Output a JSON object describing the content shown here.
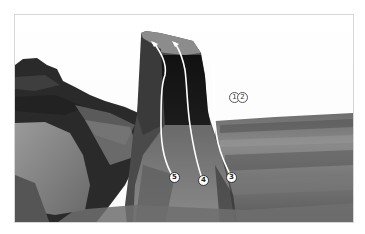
{
  "figure": {
    "type": "climbing-topo-photo",
    "color_mode": "grayscale",
    "frame_border_color": "#d6d6d6",
    "route_line_color": "#ffffff",
    "routes_on_boulder": [
      {
        "number": "5"
      },
      {
        "number": "4"
      },
      {
        "number": "3"
      }
    ],
    "offscreen_routes": [
      {
        "number": "1"
      },
      {
        "number": "2"
      }
    ]
  }
}
